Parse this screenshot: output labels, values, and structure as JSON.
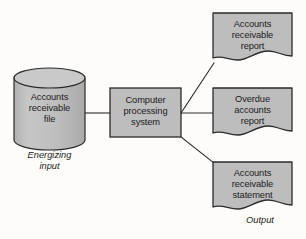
{
  "diagram": {
    "type": "flowchart",
    "colors": {
      "shape_fill": "#bdbdbd",
      "shape_fill_light": "#c9c9c9",
      "shape_stroke": "#2b2b2b",
      "connector_stroke": "#2b2b2b",
      "text": "#1c1c1c",
      "background": "#fdfcfb"
    },
    "input": {
      "shape": "cylinder-database-icon",
      "label": "Accounts\nreceivable\nfile",
      "caption": "Energizing\ninput"
    },
    "process": {
      "shape": "rectangle-process-icon",
      "label": "Computer\nprocessing\nsystem"
    },
    "outputs": {
      "caption": "Output",
      "items": [
        {
          "shape": "document-icon",
          "label": "Accounts\nreceivable\nreport"
        },
        {
          "shape": "document-icon",
          "label": "Overdue\naccounts\nreport"
        },
        {
          "shape": "document-icon",
          "label": "Accounts\nreceivable\nstatement"
        }
      ]
    },
    "connectors": [
      {
        "name": "file-to-process",
        "from": "input",
        "to": "process",
        "style": "straight-line"
      },
      {
        "name": "process-to-report-1",
        "from": "process",
        "to": "outputs.0",
        "style": "diagonal-line"
      },
      {
        "name": "process-to-report-2",
        "from": "process",
        "to": "outputs.1",
        "style": "straight-line"
      },
      {
        "name": "process-to-report-3",
        "from": "process",
        "to": "outputs.2",
        "style": "diagonal-line"
      }
    ]
  }
}
